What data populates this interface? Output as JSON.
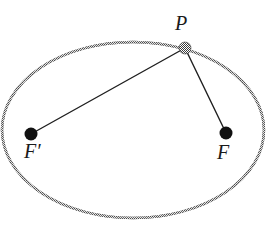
{
  "figure": {
    "background_color": "#ffffff",
    "width": 271,
    "height": 234
  },
  "geometry": {
    "ellipse": {
      "name": "ellipse-curve",
      "center_x": 133,
      "center_y": 130,
      "radius_x": 131,
      "radius_y": 88,
      "stroke_color": "#565656",
      "stroke_width": 2.4,
      "fill": "none"
    },
    "points": [
      {
        "id": "P",
        "label": "P",
        "x": 185,
        "y": 48,
        "radius": 6,
        "color": "#3b3b3b",
        "style": "dithered",
        "label_x": 182,
        "label_y": 28,
        "role": "point-on-ellipse"
      },
      {
        "id": "Fprime",
        "label": "F′",
        "x": 31,
        "y": 134,
        "radius": 6.5,
        "color": "#111111",
        "style": "solid",
        "label_x": 31,
        "label_y": 156,
        "role": "focus-left"
      },
      {
        "id": "F",
        "label": "F",
        "x": 226,
        "y": 133,
        "radius": 6.5,
        "color": "#111111",
        "style": "solid",
        "label_x": 224,
        "label_y": 157,
        "role": "focus-right"
      }
    ],
    "segments": [
      {
        "id": "PF-prime",
        "name": "segment-p-to-f-prime",
        "from": "P",
        "to": "Fprime",
        "x1": 185,
        "y1": 48,
        "x2": 31,
        "y2": 134,
        "stroke_color": "#1f1f1f",
        "stroke_width": 1.4
      },
      {
        "id": "PF",
        "name": "segment-p-to-f",
        "from": "P",
        "to": "F",
        "x1": 185,
        "y1": 48,
        "x2": 226,
        "y2": 133,
        "stroke_color": "#1f1f1f",
        "stroke_width": 1.4
      }
    ]
  },
  "labels": {
    "p": "P",
    "f_prime": "F′",
    "f": "F"
  }
}
